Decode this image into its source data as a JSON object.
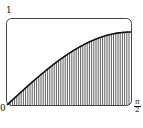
{
  "chart_data": {
    "type": "area",
    "title": "",
    "function": "sin(x)",
    "xlabel": "",
    "ylabel": "",
    "x_ticks": [
      "0",
      "π/2"
    ],
    "y_ticks": [
      "1"
    ],
    "xlim": [
      0,
      1.5708
    ],
    "ylim": [
      0,
      1
    ],
    "fill": "vertical hatching",
    "x": [
      0,
      0.1963,
      0.3927,
      0.589,
      0.7854,
      0.9817,
      1.1781,
      1.3744,
      1.5708
    ],
    "values": [
      0,
      0.195,
      0.383,
      0.556,
      0.707,
      0.831,
      0.924,
      0.981,
      1.0
    ],
    "grid": false,
    "legend": null
  },
  "labels": {
    "y_top": "1",
    "x_start": "0",
    "x_end_num": "π",
    "x_end_den": "2"
  },
  "colors": {
    "line": "#111111",
    "hatch": "#333333",
    "frame": "#444444"
  }
}
